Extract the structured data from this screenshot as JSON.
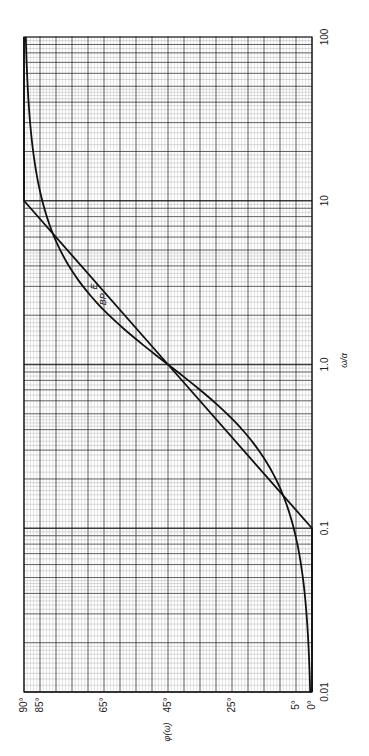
{
  "chart_data": {
    "type": "line",
    "orientation": "rotated-90-ccw",
    "title": "",
    "xlabel": "ω/α",
    "ylabel": "φ(ω)",
    "xscale": "log",
    "xlim": [
      0.01,
      100
    ],
    "ylim": [
      0,
      90
    ],
    "x_ticks": [
      "0.01",
      "0.1",
      "1.0",
      "10",
      "100"
    ],
    "y_ticks": [
      "0°",
      "5°",
      "25°",
      "45°",
      "65°",
      "85°",
      "90°"
    ],
    "y_tick_values": [
      0,
      5,
      25,
      45,
      65,
      85,
      90
    ],
    "grid": true,
    "series": [
      {
        "name": "E",
        "description": "exact phase arctan(ω/α)",
        "x": [
          0.01,
          0.02,
          0.05,
          0.1,
          0.2,
          0.5,
          1.0,
          2.0,
          5.0,
          10,
          20,
          50,
          100
        ],
        "values": [
          0.6,
          1.1,
          2.9,
          5.7,
          11.3,
          26.6,
          45.0,
          63.4,
          78.7,
          84.3,
          87.1,
          88.9,
          89.4
        ]
      },
      {
        "name": "BP",
        "description": "Bode straight-line approximation",
        "x": [
          0.01,
          0.1,
          1.0,
          10,
          100
        ],
        "values": [
          0,
          0,
          45,
          90,
          90
        ]
      }
    ],
    "annotations": [
      {
        "text": "E",
        "near_x": 3.0,
        "near_y": 68
      },
      {
        "text": "BP",
        "near_x": 2.5,
        "near_y": 65
      }
    ]
  }
}
